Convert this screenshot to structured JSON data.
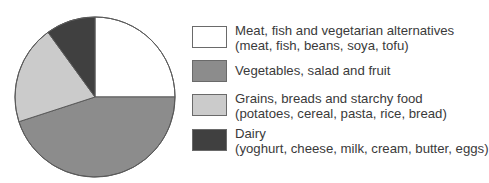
{
  "chart_data": {
    "type": "pie",
    "title": "",
    "start_angle_deg": 0,
    "direction": "clockwise",
    "legend_position": "right",
    "slices": [
      {
        "label": "Meat, fish and vegetarian alternatives",
        "detail": "(meat, fish, beans, soya, tofu)",
        "value": 25,
        "color": "#ffffff"
      },
      {
        "label": "Vegetables, salad and fruit",
        "detail": "",
        "value": 45,
        "color": "#8c8c8c"
      },
      {
        "label": "Grains, breads and starchy food",
        "detail": "(potatoes, cereal, pasta, rice, bread)",
        "value": 20,
        "color": "#cbcbcb"
      },
      {
        "label": "Dairy",
        "detail": "(yoghurt, cheese, milk, cream, butter, eggs)",
        "value": 10,
        "color": "#404040"
      }
    ],
    "categories": [
      "Meat, fish and vegetarian alternatives",
      "Vegetables, salad and fruit",
      "Grains, breads and starchy food",
      "Dairy"
    ],
    "values": [
      25,
      45,
      20,
      10
    ]
  },
  "legend": {
    "items": [
      {
        "line1": "Meat, fish and vegetarian alternatives",
        "line2": "(meat, fish, beans, soya, tofu)"
      },
      {
        "line1": "Vegetables, salad and fruit",
        "line2": ""
      },
      {
        "line1": "Grains, breads and starchy food",
        "line2": "(potatoes, cereal, pasta, rice, bread)"
      },
      {
        "line1": "Dairy",
        "line2": "(yoghurt, cheese, milk, cream, butter, eggs)"
      }
    ]
  }
}
